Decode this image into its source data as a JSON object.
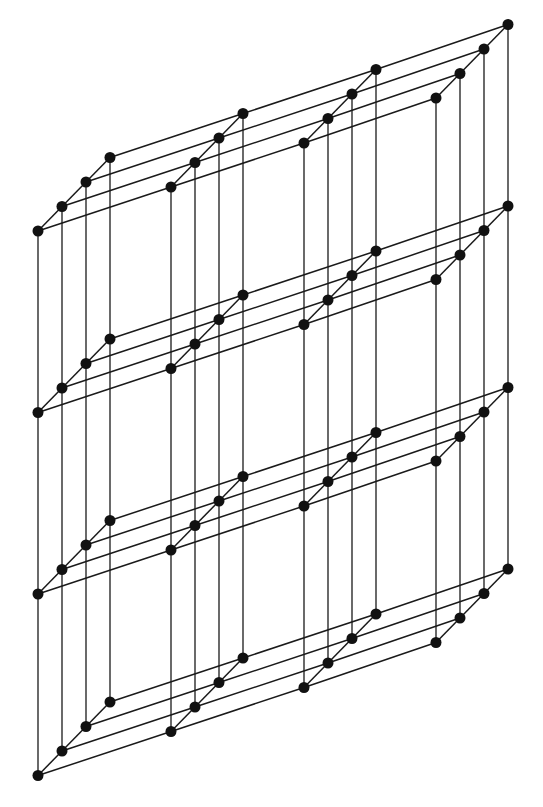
{
  "diagram": {
    "type": "3d-lattice",
    "columns": [
      {
        "name": "A",
        "front": [
          38,
          231
        ]
      },
      {
        "name": "B",
        "front": [
          171,
          187
        ]
      },
      {
        "name": "C",
        "front": [
          304,
          143
        ]
      },
      {
        "name": "D",
        "front": [
          436,
          98
        ]
      }
    ],
    "depth_step": [
      24,
      -24.5
    ],
    "depth_count": 4,
    "level_count": 4,
    "level_step": 181.5,
    "node_radius": 5.5,
    "line_color": "#1a1a1a",
    "node_color": "#111111"
  }
}
